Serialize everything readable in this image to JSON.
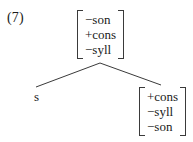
{
  "figure": {
    "example_number": "(7)",
    "type": "phonological-feature-tree",
    "line_color": "#3a3a3a",
    "text_color": "#1a1a1a",
    "background_color": "#ffffff"
  },
  "tree": {
    "mother": {
      "name": "mother-feature-matrix",
      "features": [
        {
          "value": "−son"
        },
        {
          "value": "+cons"
        },
        {
          "value": "−syll"
        }
      ]
    },
    "daughters": [
      {
        "name": "terminal-s",
        "kind": "terminal",
        "label": "s"
      },
      {
        "name": "daughter-feature-matrix",
        "kind": "matrix",
        "features": [
          {
            "value": "+cons"
          },
          {
            "value": "−syll"
          },
          {
            "value": "−son"
          }
        ]
      }
    ]
  },
  "branches": [
    {
      "name": "branch-left",
      "from": [
        100,
        63
      ],
      "to": [
        36,
        87
      ]
    },
    {
      "name": "branch-right",
      "from": [
        100,
        63
      ],
      "to": [
        161,
        85
      ]
    }
  ]
}
